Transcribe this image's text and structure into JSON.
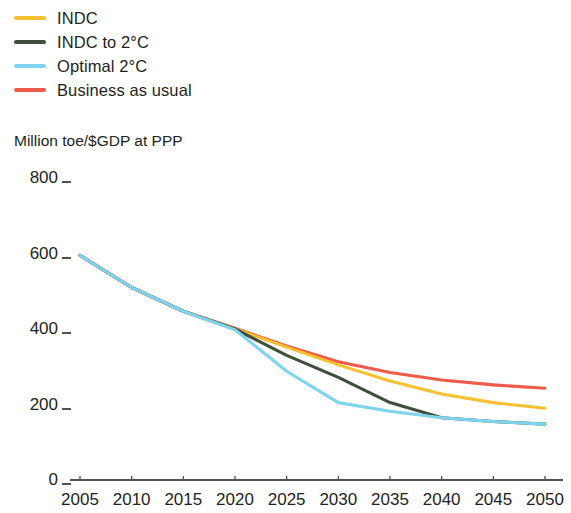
{
  "chart_data": {
    "type": "line",
    "title": "",
    "subtitle": "",
    "xlabel": "",
    "ylabel": "Million toe/$GDP at PPP",
    "xlim": [
      2005,
      2050
    ],
    "ylim": [
      0,
      800
    ],
    "grid": false,
    "legend_position": "top-left",
    "x": [
      2005,
      2010,
      2015,
      2020,
      2025,
      2030,
      2035,
      2040,
      2045,
      2050
    ],
    "xtick_labels": [
      "2005",
      "2010",
      "2015",
      "2020",
      "2025",
      "2030",
      "2035",
      "2040",
      "2045",
      "2050"
    ],
    "ytick_labels": [
      "0",
      "200",
      "400",
      "600",
      "800"
    ],
    "ytick_values": [
      0,
      200,
      400,
      600,
      800
    ],
    "series": [
      {
        "name": "INDC",
        "color": "#f6c02f",
        "x": [
          2005,
          2010,
          2015,
          2020,
          2025,
          2030,
          2035,
          2040,
          2045,
          2050
        ],
        "values": [
          595,
          510,
          447,
          400,
          352,
          305,
          262,
          228,
          205,
          190
        ]
      },
      {
        "name": "INDC to 2°C",
        "color": "#3f4f3c",
        "x": [
          2005,
          2010,
          2015,
          2020,
          2025,
          2030,
          2035,
          2040,
          2045,
          2050
        ],
        "values": [
          595,
          510,
          447,
          400,
          330,
          272,
          205,
          165,
          155,
          148
        ]
      },
      {
        "name": "Optimal 2°C",
        "color": "#7ed3ef",
        "x": [
          2005,
          2010,
          2015,
          2020,
          2025,
          2030,
          2035,
          2040,
          2045,
          2050
        ],
        "values": [
          595,
          510,
          447,
          398,
          288,
          205,
          182,
          165,
          155,
          148
        ]
      },
      {
        "name": "Business as usual",
        "color": "#ef5a4a",
        "x": [
          2005,
          2010,
          2015,
          2020,
          2025,
          2030,
          2035,
          2040,
          2045,
          2050
        ],
        "values": [
          595,
          510,
          447,
          402,
          355,
          313,
          285,
          265,
          252,
          243
        ]
      }
    ]
  },
  "legend": {
    "items": [
      {
        "label": "INDC",
        "color": "#f6c02f"
      },
      {
        "label": "INDC to 2°C",
        "color": "#3f4f3c"
      },
      {
        "label": "Optimal 2°C",
        "color": "#7ed3ef"
      },
      {
        "label": "Business as usual",
        "color": "#ef5a4a"
      }
    ]
  },
  "axis": {
    "y_title": "Million toe/$GDP at PPP",
    "y_ticks": [
      "800",
      "600",
      "400",
      "200",
      "0"
    ],
    "x_ticks": [
      "2005",
      "2010",
      "2015",
      "2020",
      "2025",
      "2030",
      "2035",
      "2040",
      "2045",
      "2050"
    ],
    "axis_color": "#55514f"
  }
}
